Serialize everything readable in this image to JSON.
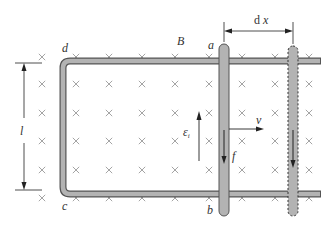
{
  "diagram": {
    "labels": {
      "field": "B",
      "corner_top_left": "d",
      "corner_bottom_left": "c",
      "rod_top": "a",
      "rod_bottom": "b",
      "length": "l",
      "displacement_d": "d",
      "displacement_x": "x",
      "emf_symbol": "ε",
      "emf_subscript": "i",
      "velocity": "v",
      "force": "f"
    },
    "field_marker": "×",
    "field_direction": "into-page",
    "colors": {
      "rail_fill": "#b3b3b3",
      "rail_stroke": "#555555",
      "cross": "#9a9a9a",
      "arrow": "#222222",
      "text": "#333333"
    },
    "grid": {
      "columns_x": [
        42,
        76,
        109,
        142,
        175,
        209,
        242,
        275,
        309
      ],
      "rows_y": [
        57,
        84,
        113,
        141,
        170,
        198
      ]
    }
  }
}
